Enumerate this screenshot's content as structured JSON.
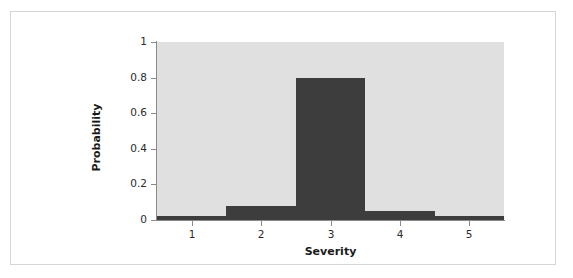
{
  "chart_data": {
    "type": "bar",
    "title": "",
    "subtitle": "",
    "xlabel": "Severity",
    "ylabel": "Probability",
    "categories": [
      "1",
      "2",
      "3",
      "4",
      "5"
    ],
    "values": [
      0.02,
      0.08,
      0.8,
      0.05,
      0.02
    ],
    "series": [
      {
        "name": "Probability",
        "values": [
          0.02,
          0.08,
          0.8,
          0.05,
          0.02
        ]
      }
    ],
    "xlim": [
      0.5,
      5.5
    ],
    "ylim": [
      0,
      1
    ],
    "y_ticks": [
      0,
      0.2,
      0.4,
      0.6,
      0.8,
      1
    ],
    "y_tick_labels": [
      "0",
      "0.2",
      "0.4",
      "0.6",
      "0.8",
      "1"
    ],
    "x_ticks": [
      1,
      2,
      3,
      4,
      5
    ],
    "x_tick_labels": [
      "1",
      "2",
      "3",
      "4",
      "5"
    ],
    "grid": false,
    "legend": null,
    "legend_position": "none",
    "bar_style": "histogram-contiguous",
    "colors": {
      "bar": "#3d3d3d",
      "plot_background": "#e0e0e0",
      "figure_background": "#ffffff",
      "axis_line": "#8a8a8a",
      "frame_border": "#d6d6d6",
      "tick_label": "#2b2b2b",
      "axis_title": "#1a1a1a"
    },
    "annotations": []
  }
}
